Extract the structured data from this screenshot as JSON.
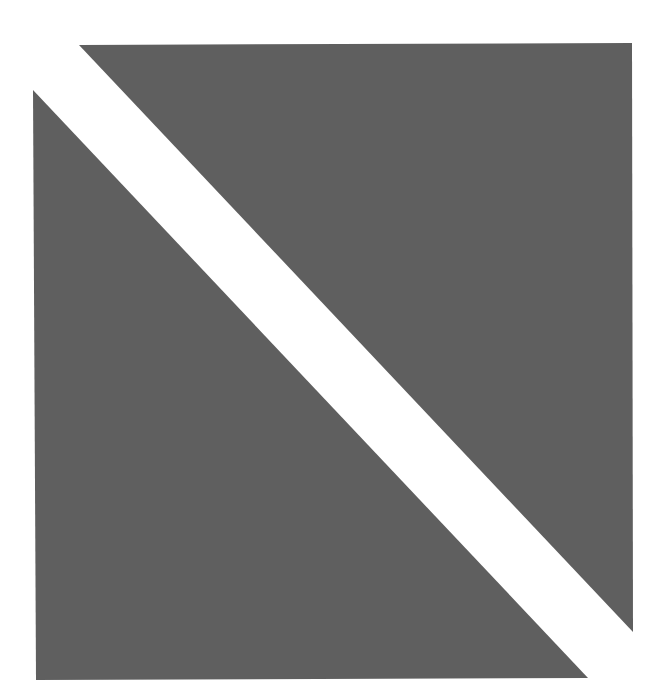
{
  "canvas": {
    "width": 672,
    "height": 695,
    "background": "#ffffff"
  },
  "shapes": {
    "fill_color": "#5f5f5f",
    "upper_triangle": {
      "points": "79,45 632,43 633,632"
    },
    "lower_triangle": {
      "points": "33,90 36,680 588,678"
    }
  }
}
